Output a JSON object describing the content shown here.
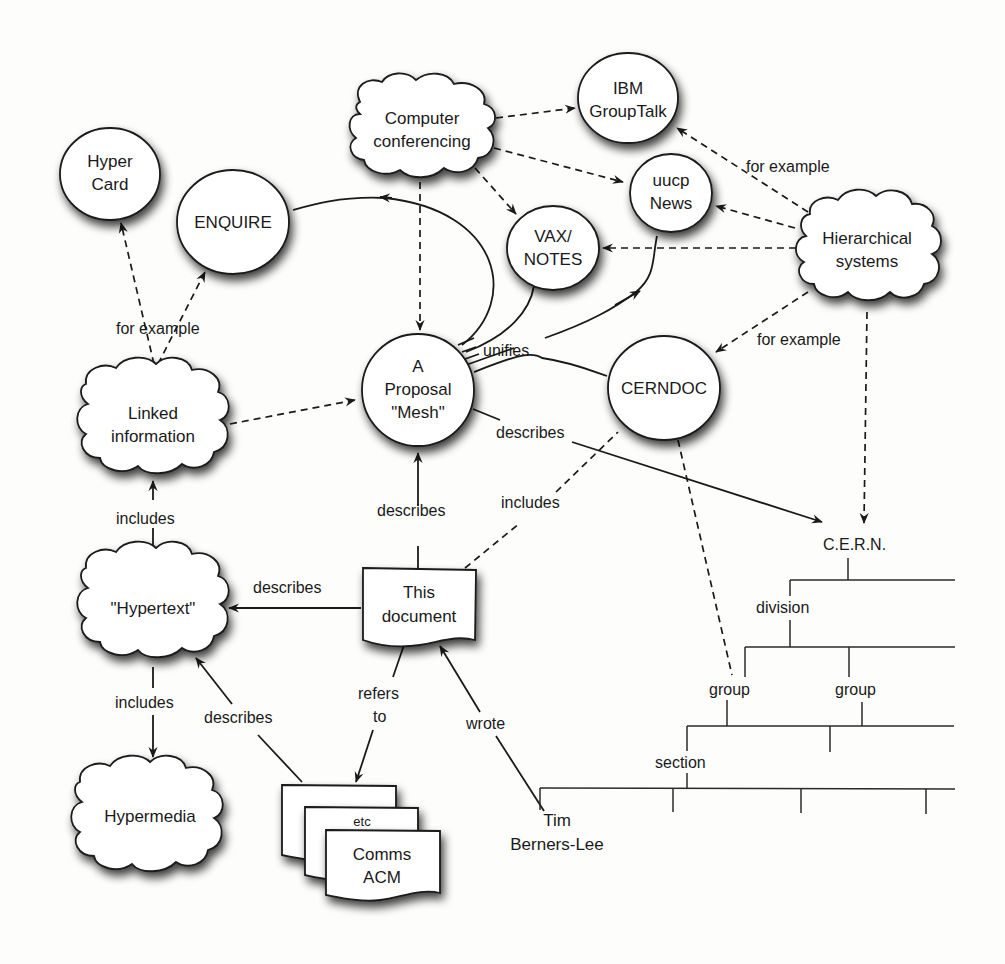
{
  "diagram": {
    "style": {
      "background": "#fdfdfb",
      "ink": "#1a1a1a",
      "shape_fill": "#ffffff"
    },
    "nodes": {
      "hypercard": {
        "shape": "circle",
        "lines": [
          "Hyper",
          "Card"
        ]
      },
      "enquire": {
        "shape": "circle",
        "lines": [
          "ENQUIRE"
        ]
      },
      "computer_conferencing": {
        "shape": "cloud",
        "lines": [
          "Computer",
          "conferencing"
        ]
      },
      "ibm_grouptalk": {
        "shape": "circle",
        "lines": [
          "IBM",
          "GroupTalk"
        ]
      },
      "uucp_news": {
        "shape": "circle",
        "lines": [
          "uucp",
          "News"
        ]
      },
      "vax_notes": {
        "shape": "circle",
        "lines": [
          "VAX/",
          "NOTES"
        ]
      },
      "hierarchical_systems": {
        "shape": "cloud",
        "lines": [
          "Hierarchical",
          "systems"
        ]
      },
      "linked_information": {
        "shape": "cloud",
        "lines": [
          "Linked",
          "information"
        ]
      },
      "proposal_mesh": {
        "shape": "circle",
        "lines": [
          "A",
          "Proposal",
          "\"Mesh\""
        ]
      },
      "cerndoc": {
        "shape": "circle",
        "lines": [
          "CERNDOC"
        ]
      },
      "hypertext": {
        "shape": "cloud",
        "lines": [
          "\"Hypertext\""
        ]
      },
      "this_document": {
        "shape": "document",
        "lines": [
          "This",
          "document"
        ]
      },
      "hypermedia": {
        "shape": "cloud",
        "lines": [
          "Hypermedia"
        ]
      },
      "comms_acm": {
        "shape": "document-stack",
        "lines": [
          "Comms",
          "ACM"
        ],
        "stack_label": "etc"
      },
      "tim_berners_lee": {
        "shape": "text",
        "lines": [
          "Tim",
          "Berners-Lee"
        ]
      },
      "cern": {
        "shape": "text",
        "lines": [
          "C.E.R.N."
        ]
      }
    },
    "edge_labels": {
      "for_example_left": "for example",
      "for_example_top_right": "for example",
      "for_example_right": "for example",
      "unifies": "unifies",
      "describes_mesh_cern": "describes",
      "describes_doc_mesh": "describes",
      "includes_doc_cerndoc": "includes",
      "includes_hypertext_linked": "includes",
      "describes_doc_hypertext": "describes",
      "includes_hypertext_hypermedia": "includes",
      "describes_acm_hypertext": "describes",
      "refers_to_1": "refers",
      "refers_to_2": "to",
      "wrote": "wrote"
    },
    "edges": [
      {
        "from": "computer_conferencing",
        "to": "ibm_grouptalk",
        "style": "dashed"
      },
      {
        "from": "computer_conferencing",
        "to": "uucp_news",
        "style": "dashed"
      },
      {
        "from": "computer_conferencing",
        "to": "vax_notes",
        "style": "dashed"
      },
      {
        "from": "computer_conferencing",
        "to": "proposal_mesh",
        "style": "dashed"
      },
      {
        "from": "hierarchical_systems",
        "to": "ibm_grouptalk",
        "style": "dashed",
        "label": "for example"
      },
      {
        "from": "hierarchical_systems",
        "to": "uucp_news",
        "style": "dashed"
      },
      {
        "from": "hierarchical_systems",
        "to": "vax_notes",
        "style": "dashed"
      },
      {
        "from": "hierarchical_systems",
        "to": "cerndoc",
        "style": "dashed",
        "label": "for example"
      },
      {
        "from": "hierarchical_systems",
        "to": "cern",
        "style": "dashed"
      },
      {
        "from": "linked_information",
        "to": "hypercard",
        "style": "dashed",
        "label": "for example"
      },
      {
        "from": "linked_information",
        "to": "enquire",
        "style": "dashed",
        "label": "for example"
      },
      {
        "from": "linked_information",
        "to": "proposal_mesh",
        "style": "dashed"
      },
      {
        "from": "proposal_mesh",
        "to": "enquire",
        "style": "solid",
        "label": "unifies"
      },
      {
        "from": "proposal_mesh",
        "to": "vax_notes",
        "style": "solid",
        "label": "unifies"
      },
      {
        "from": "proposal_mesh",
        "to": "uucp_news",
        "style": "solid",
        "label": "unifies"
      },
      {
        "from": "proposal_mesh",
        "to": "cerndoc",
        "style": "solid",
        "label": "unifies"
      },
      {
        "from": "proposal_mesh",
        "to": "cern",
        "style": "solid",
        "label": "describes"
      },
      {
        "from": "this_document",
        "to": "proposal_mesh",
        "style": "solid",
        "label": "describes"
      },
      {
        "from": "this_document",
        "to": "cerndoc",
        "style": "dashed",
        "label": "includes"
      },
      {
        "from": "this_document",
        "to": "hypertext",
        "style": "solid",
        "label": "describes"
      },
      {
        "from": "this_document",
        "to": "comms_acm",
        "style": "solid",
        "label": "refers to"
      },
      {
        "from": "hypertext",
        "to": "linked_information",
        "style": "solid",
        "label": "includes"
      },
      {
        "from": "hypertext",
        "to": "hypermedia",
        "style": "solid",
        "label": "includes"
      },
      {
        "from": "comms_acm",
        "to": "hypertext",
        "style": "solid",
        "label": "describes"
      },
      {
        "from": "tim_berners_lee",
        "to": "this_document",
        "style": "solid",
        "label": "wrote"
      },
      {
        "from": "cerndoc",
        "to": "tree_group",
        "style": "dashed"
      }
    ],
    "org_tree": {
      "root": "C.E.R.N.",
      "level1": "division",
      "level2": [
        "group",
        "group"
      ],
      "level3": "section"
    }
  }
}
